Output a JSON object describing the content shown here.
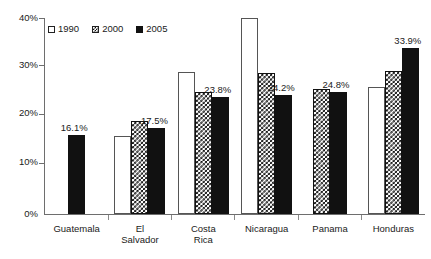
{
  "chart_data": {
    "type": "bar",
    "title": "",
    "subtitle": "",
    "xlabel": "",
    "ylabel": "",
    "ylim": [
      0,
      40
    ],
    "ytick_values": [
      0,
      10,
      20,
      30,
      40
    ],
    "ytick_labels": [
      "0%",
      "10%",
      "20%",
      "30%",
      "40%"
    ],
    "grid": false,
    "legend_position": "top-left",
    "value_suffix": "%",
    "categories": [
      "Guatemala",
      "El Salvador",
      "Costa Rica",
      "Nicaragua",
      "Panama",
      "Honduras"
    ],
    "category_labels_wrapped": [
      [
        "Guatemala"
      ],
      [
        "El",
        "Salvador"
      ],
      [
        "Costa",
        "Rica"
      ],
      [
        "Nicaragua"
      ],
      [
        "Panama"
      ],
      [
        "Honduras"
      ]
    ],
    "series": [
      {
        "name": "1990",
        "fill": "white-outline",
        "values": [
          null,
          16.0,
          29.0,
          40.0,
          null,
          26.0
        ]
      },
      {
        "name": "2000",
        "fill": "checkered",
        "values": [
          null,
          19.0,
          25.0,
          28.7,
          25.5,
          29.2
        ]
      },
      {
        "name": "2005",
        "fill": "solid-black",
        "values": [
          16.1,
          17.5,
          23.8,
          24.2,
          24.8,
          33.9
        ]
      }
    ],
    "data_labels": [
      {
        "category": "Guatemala",
        "series": "2005",
        "text": "16.1%"
      },
      {
        "category": "El Salvador",
        "series": "2005",
        "text": "17.5%"
      },
      {
        "category": "Costa Rica",
        "series": "2005",
        "text": "23.8%"
      },
      {
        "category": "Nicaragua",
        "series": "2005",
        "text": "24.2%"
      },
      {
        "category": "Panama",
        "series": "2005",
        "text": "24.8%"
      },
      {
        "category": "Honduras",
        "series": "2005",
        "text": "33.9%"
      }
    ],
    "colors": {
      "series_1990": "#ffffff",
      "series_2000": "#111111",
      "series_2005": "#111111",
      "axis": "#6e6e6e",
      "text": "#1a1a1a",
      "background": "#ffffff"
    }
  },
  "legend": {
    "items": [
      {
        "label": "1990"
      },
      {
        "label": "2000"
      },
      {
        "label": "2005"
      }
    ]
  }
}
